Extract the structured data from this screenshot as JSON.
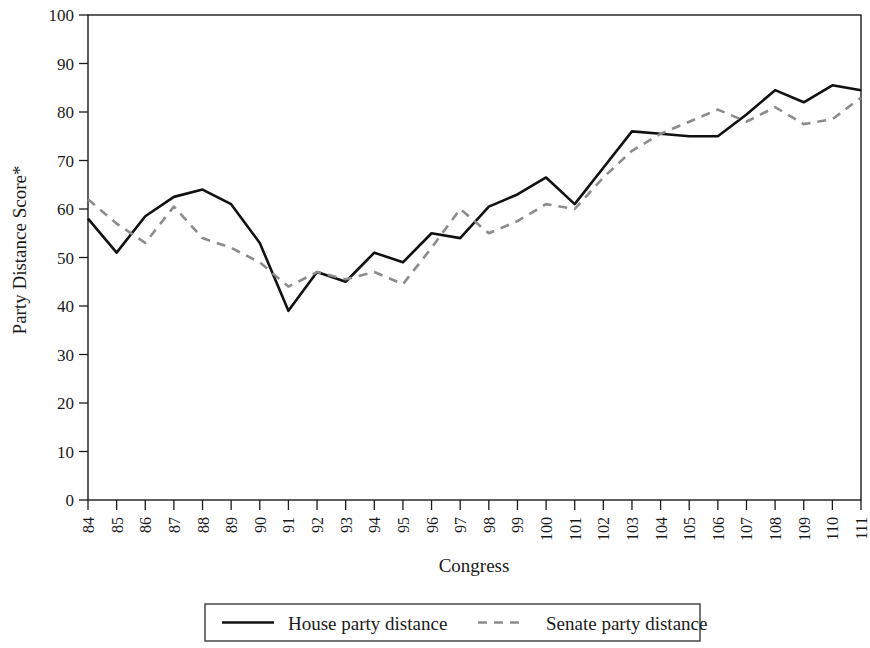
{
  "chart_data": {
    "type": "line",
    "title": "",
    "xlabel": "Congress",
    "ylabel": "Party Distance Score*",
    "categories": [
      "84",
      "85",
      "86",
      "87",
      "88",
      "89",
      "90",
      "91",
      "92",
      "93",
      "94",
      "95",
      "96",
      "97",
      "98",
      "99",
      "100",
      "101",
      "102",
      "103",
      "104",
      "105",
      "106",
      "107",
      "108",
      "109",
      "110",
      "111"
    ],
    "xlim": [
      84,
      111
    ],
    "ylim": [
      0,
      100
    ],
    "yticks": [
      0,
      10,
      20,
      30,
      40,
      50,
      60,
      70,
      80,
      90,
      100
    ],
    "grid": false,
    "legend_position": "bottom-center",
    "series": [
      {
        "name": "House party distance",
        "style": "solid",
        "color": "#111111",
        "width": 2.6,
        "values": [
          58,
          51,
          58.5,
          62.5,
          64,
          61,
          53,
          39,
          47,
          45,
          51,
          49,
          55,
          54,
          60.5,
          63,
          66.5,
          61,
          68.5,
          76,
          75.5,
          75,
          75,
          79.5,
          84.5,
          82,
          85.5,
          84.5
        ]
      },
      {
        "name": "Senate party distance",
        "style": "dashed",
        "color": "#8c8c8c",
        "width": 2.6,
        "values": [
          62,
          57,
          53,
          60.5,
          54,
          52,
          49,
          44,
          47,
          45.5,
          47,
          44.5,
          52,
          60,
          55,
          57.5,
          61,
          60,
          66.5,
          72,
          75.5,
          78,
          80.5,
          78,
          81,
          77.5,
          78.5,
          83
        ]
      }
    ]
  },
  "axes": {
    "ylabel": "Party Distance Score*",
    "xlabel": "Congress",
    "ytick_labels": [
      "100",
      "90",
      "80",
      "70",
      "60",
      "50",
      "40",
      "30",
      "20",
      "10",
      "0"
    ],
    "xtick_labels": [
      "84",
      "85",
      "86",
      "87",
      "88",
      "89",
      "90",
      "91",
      "92",
      "93",
      "94",
      "95",
      "96",
      "97",
      "98",
      "99",
      "100",
      "101",
      "102",
      "103",
      "104",
      "105",
      "106",
      "107",
      "108",
      "109",
      "110",
      "111"
    ]
  },
  "legend": {
    "items": [
      {
        "label": "House party distance",
        "swatch": "solid-line-swatch",
        "color": "#111111"
      },
      {
        "label": "Senate party distance",
        "swatch": "dashed-line-swatch",
        "color": "#8c8c8c"
      }
    ]
  },
  "colors": {
    "house_line": "#111111",
    "senate_line": "#8c8c8c",
    "axis": "#1a1a1a",
    "background": "#ffffff"
  }
}
